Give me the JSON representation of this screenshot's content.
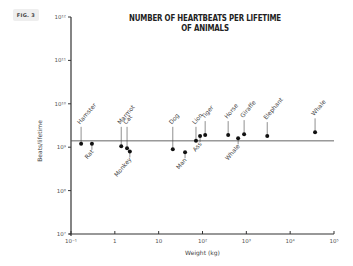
{
  "figure": {
    "badge": "FIG. 3"
  },
  "chart_data": {
    "type": "scatter",
    "title": "NUMBER OF HEARTBEATS PER LIFETIME OF ANIMALS",
    "xlabel": "Weight (kg)",
    "ylabel": "Beats/lifetime",
    "xscale": "log",
    "yscale": "log",
    "xlim": [
      0.1,
      100000
    ],
    "ylim": [
      10000000,
      1000000000000
    ],
    "x_ticks": [
      "10⁻¹",
      "1",
      "10",
      "10²",
      "10³",
      "10⁴",
      "10⁵"
    ],
    "y_ticks": [
      "10⁷",
      "10⁸",
      "10⁹",
      "10¹⁰",
      "10¹¹",
      "10¹²"
    ],
    "grid": false,
    "reference_line": {
      "y": 1400000000,
      "label": ""
    },
    "points": [
      {
        "label": "Hamster",
        "x": 0.17,
        "y": 1200000000,
        "label_side": "above"
      },
      {
        "label": "Rat",
        "x": 0.3,
        "y": 1200000000,
        "label_side": "below"
      },
      {
        "label": "Marmot",
        "x": 1.4,
        "y": 1050000000,
        "label_side": "above"
      },
      {
        "label": "Cat",
        "x": 1.9,
        "y": 950000000,
        "label_side": "above"
      },
      {
        "label": "Monkey",
        "x": 2.2,
        "y": 800000000,
        "label_side": "below"
      },
      {
        "label": "Dog",
        "x": 21,
        "y": 900000000,
        "label_side": "above"
      },
      {
        "label": "Man",
        "x": 40,
        "y": 770000000,
        "label_side": "below"
      },
      {
        "label": "Lion",
        "x": 71,
        "y": 1400000000,
        "label_side": "above"
      },
      {
        "label": "Ass",
        "x": 88,
        "y": 1800000000,
        "label_side": "below"
      },
      {
        "label": "Tiger",
        "x": 115,
        "y": 1900000000,
        "label_side": "above"
      },
      {
        "label": "Horse",
        "x": 385,
        "y": 1900000000,
        "label_side": "above"
      },
      {
        "label": "Whale",
        "x": 650,
        "y": 1600000000,
        "label_side": "below"
      },
      {
        "label": "Giraffe",
        "x": 890,
        "y": 2000000000,
        "label_side": "above"
      },
      {
        "label": "Elephant",
        "x": 3000,
        "y": 1800000000,
        "label_side": "above"
      },
      {
        "label": "Whale",
        "x": 37000,
        "y": 2200000000,
        "label_side": "above"
      }
    ]
  }
}
